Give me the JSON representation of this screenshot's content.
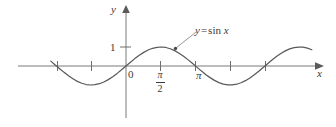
{
  "figure": {
    "background_color": "#ffffff",
    "ink_color": "#6e6e6e",
    "text_color": "#3a3a3a"
  },
  "axes": {
    "y_axis_label": "y",
    "x_axis_label": "x",
    "origin_label": "0",
    "y_tick_label": "1"
  },
  "ticks": {
    "pi_label": "π",
    "pi_half_numerator": "π",
    "pi_half_denominator": "2"
  },
  "annotation": {
    "curve_label_lhs": "y",
    "curve_label_op": "=",
    "curve_label_fn": "sin",
    "curve_label_arg": "x"
  },
  "chart_data": {
    "type": "line",
    "xlabel": "x",
    "ylabel": "y",
    "xlim": [
      -3.4,
      8.6
    ],
    "ylim": [
      -1.7,
      2.1
    ],
    "grid": false,
    "legend": null,
    "series": [
      {
        "name": "y = sin x",
        "expression": "sin(x)",
        "x": [
          -3.4,
          -3.2,
          -3.0,
          -2.8,
          -2.6,
          -2.4,
          -2.2,
          -2.0,
          -1.8,
          -1.6,
          -1.4,
          -1.2,
          -1.0,
          -0.8,
          -0.6,
          -0.4,
          -0.2,
          0.0,
          0.2,
          0.4,
          0.6,
          0.8,
          1.0,
          1.2,
          1.4,
          1.6,
          1.8,
          2.0,
          2.2,
          2.4,
          2.6,
          2.8,
          3.0,
          3.2,
          3.4,
          3.6,
          3.8,
          4.0,
          4.2,
          4.4,
          4.6,
          4.8,
          5.0,
          5.2,
          5.4,
          5.6,
          5.8,
          6.0,
          6.2,
          6.4,
          6.6,
          6.8,
          7.0,
          7.2,
          7.4,
          7.6,
          7.8,
          8.0,
          8.2,
          8.4
        ],
        "y": [
          0.256,
          0.058,
          -0.141,
          -0.335,
          -0.516,
          -0.675,
          -0.808,
          -0.909,
          -0.974,
          -1.0,
          -0.985,
          -0.932,
          -0.841,
          -0.717,
          -0.565,
          -0.389,
          -0.199,
          0.0,
          0.199,
          0.389,
          0.565,
          0.717,
          0.841,
          0.932,
          0.985,
          1.0,
          0.974,
          0.909,
          0.808,
          0.675,
          0.516,
          0.335,
          0.141,
          -0.058,
          -0.256,
          -0.443,
          -0.612,
          -0.757,
          -0.872,
          -0.952,
          -0.994,
          -0.996,
          -0.959,
          -0.883,
          -0.773,
          -0.631,
          -0.465,
          -0.279,
          -0.083,
          0.116,
          0.311,
          0.495,
          0.657,
          0.794,
          0.899,
          0.969,
          0.999,
          0.989,
          0.941,
          0.855
        ]
      }
    ],
    "x_tick_values": [
      -3.141593,
      -1.570796,
      0,
      1.570796,
      3.141593,
      4.712389,
      6.283185
    ],
    "x_tick_labels": [
      "",
      "",
      "0",
      "π/2",
      "π",
      "",
      ""
    ],
    "y_tick_values": [
      1
    ],
    "y_tick_labels": [
      "1"
    ],
    "annotations": [
      {
        "text": "y = sin x",
        "points_to_x": 1.9,
        "points_to_y": 0.95
      }
    ]
  }
}
